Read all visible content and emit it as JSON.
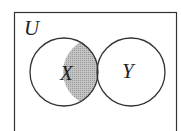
{
  "diagram": {
    "type": "venn",
    "universe_label": "U",
    "sets": [
      {
        "label": "X"
      },
      {
        "label": "Y"
      }
    ],
    "shaded_region": "X ∩ Y",
    "colors": {
      "stroke": "#333333",
      "shade": "#b8b8b8",
      "background": "#ffffff"
    }
  }
}
